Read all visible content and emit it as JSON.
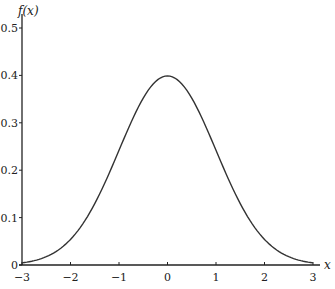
{
  "chart_data": {
    "type": "line",
    "title": "",
    "xlabel": "x",
    "ylabel": "f(x)",
    "xlim": [
      -3,
      3
    ],
    "ylim": [
      0,
      0.5
    ],
    "x_ticks": [
      "−3",
      "−2",
      "−1",
      "0",
      "1",
      "2",
      "3"
    ],
    "y_ticks": [
      "0",
      "0.1",
      "0.2",
      "0.3",
      "0.4",
      "0.5"
    ],
    "grid": false,
    "legend": null,
    "series": [
      {
        "name": "standard normal density",
        "x": [
          -3,
          -2.5,
          -2,
          -1.5,
          -1,
          -0.5,
          0,
          0.5,
          1,
          1.5,
          2,
          2.5,
          3
        ],
        "values": [
          0.004,
          0.018,
          0.054,
          0.13,
          0.242,
          0.352,
          0.399,
          0.352,
          0.242,
          0.13,
          0.054,
          0.018,
          0.004
        ]
      }
    ]
  },
  "labels": {
    "ylabel": "f(x)",
    "xlabel": "x"
  }
}
